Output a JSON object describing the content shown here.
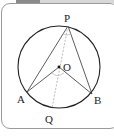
{
  "diagram": {
    "type": "circle-inscribed-angle",
    "points": {
      "P": {
        "label": "P",
        "x": 68,
        "y": 25
      },
      "A": {
        "label": "A",
        "x": 27,
        "y": 93
      },
      "B": {
        "label": "B",
        "x": 92,
        "y": 95
      },
      "Q": {
        "label": "Q",
        "x": 52,
        "y": 109
      },
      "O": {
        "label": "O",
        "x": 59,
        "y": 68
      }
    },
    "circle": {
      "cx": 59,
      "cy": 67,
      "r": 41
    },
    "colors": {
      "stroke": "#222222",
      "dashed": "#aaaaaa",
      "frame": "#9a9a9a"
    }
  }
}
